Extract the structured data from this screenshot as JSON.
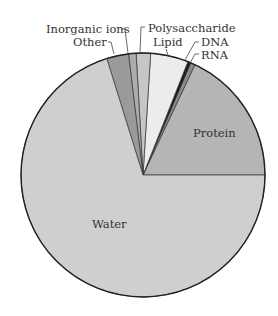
{
  "chart_data": {
    "type": "pie",
    "title": "",
    "start_angle_deg": 0,
    "direction": "counterclockwise",
    "center": [
      143,
      175
    ],
    "radius": 122,
    "slices": [
      {
        "label": "Protein",
        "value": 18.0,
        "color": "#b5b5b5"
      },
      {
        "label": "RNA",
        "value": 0.6,
        "color": "#8c8c8c"
      },
      {
        "label": "DNA",
        "value": 0.4,
        "color": "#1a1a1a"
      },
      {
        "label": "Lipid",
        "value": 5.0,
        "color": "#ececec"
      },
      {
        "label": "Polysaccharide",
        "value": 1.9,
        "color": "#c6c6c6"
      },
      {
        "label": "Inorganic ions",
        "value": 1.0,
        "color": "#acacac"
      },
      {
        "label": "Other",
        "value": 2.9,
        "color": "#9a9a9a"
      },
      {
        "label": "Water",
        "value": 70.2,
        "color": "#cfcfcf"
      }
    ],
    "labels": [
      {
        "text": "Inorganic ions",
        "x": 46,
        "y": 33,
        "anchor": "start",
        "leader": [
          [
            121,
            29
          ],
          [
            125,
            29
          ],
          [
            128,
            53
          ]
        ]
      },
      {
        "text": "Other",
        "x": 73,
        "y": 46,
        "anchor": "start",
        "leader": [
          [
            108,
            42
          ],
          [
            111,
            42
          ],
          [
            114,
            54
          ]
        ]
      },
      {
        "text": "Polysaccharide",
        "x": 148,
        "y": 32,
        "anchor": "start",
        "leader": [
          [
            145,
            27
          ],
          [
            141,
            27
          ],
          [
            140,
            53
          ]
        ]
      },
      {
        "text": "Lipid",
        "x": 153,
        "y": 46,
        "anchor": "start",
        "leader": [
          [
            166,
            49
          ],
          [
            168,
            55
          ]
        ]
      },
      {
        "text": "DNA",
        "x": 201,
        "y": 46,
        "anchor": "start",
        "leader": [
          [
            199,
            42
          ],
          [
            195,
            42
          ],
          [
            185,
            60
          ]
        ]
      },
      {
        "text": "RNA",
        "x": 201,
        "y": 59,
        "anchor": "start",
        "leader": [
          [
            199,
            54
          ],
          [
            195,
            54
          ],
          [
            190,
            63
          ]
        ]
      },
      {
        "text": "Protein",
        "x": 193,
        "y": 137,
        "anchor": "start",
        "leader": []
      },
      {
        "text": "Water",
        "x": 92,
        "y": 228,
        "anchor": "start",
        "leader": []
      }
    ],
    "legend": null,
    "grid": false
  }
}
